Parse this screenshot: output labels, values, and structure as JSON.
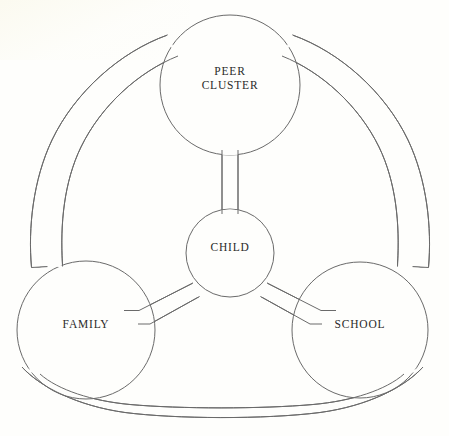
{
  "diagram": {
    "type": "venn-network",
    "background_color": "#fefefc",
    "stroke_color": "#6a6a6a",
    "text_color": "#2a2a2a",
    "nodes": [
      {
        "id": "peer-cluster",
        "label": "PEER\nCLUSTER",
        "cx": 230,
        "cy": 85,
        "r": 70,
        "label_x": 230,
        "label_y": 78
      },
      {
        "id": "child",
        "label": "CHILD",
        "cx": 230,
        "cy": 253,
        "r": 44,
        "label_x": 230,
        "label_y": 247
      },
      {
        "id": "family",
        "label": "FAMILY",
        "cx": 86,
        "cy": 330,
        "r": 69,
        "label_x": 86,
        "label_y": 324
      },
      {
        "id": "school",
        "label": "SCHOOL",
        "cx": 360,
        "cy": 330,
        "r": 68,
        "label_x": 360,
        "label_y": 324
      }
    ],
    "spokes": [
      {
        "id": "child-to-peer-cluster",
        "from": "child",
        "to": "peer-cluster"
      },
      {
        "id": "child-to-family",
        "from": "child",
        "to": "family"
      },
      {
        "id": "child-to-school",
        "from": "child",
        "to": "school"
      }
    ],
    "arcs": [
      {
        "id": "peer-cluster-to-family",
        "from": "peer-cluster",
        "to": "family"
      },
      {
        "id": "peer-cluster-to-school",
        "from": "peer-cluster",
        "to": "school"
      },
      {
        "id": "family-to-school",
        "from": "family",
        "to": "school"
      }
    ]
  }
}
